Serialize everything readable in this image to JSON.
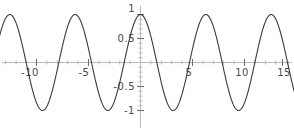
{
  "chart_data": {
    "type": "line",
    "title": "",
    "subtitle": "",
    "xlabel": "",
    "ylabel": "",
    "function": "cos(x)",
    "xlim": [
      -13.7,
      15.0
    ],
    "ylim": [
      -1.0,
      1.0
    ],
    "grid": false,
    "legend": null,
    "legend_position": "none",
    "x_ticks": [
      -10,
      -5,
      5,
      10,
      15
    ],
    "x_tick_labels": [
      "-10",
      "-5",
      "5",
      "10",
      "15"
    ],
    "y_ticks": [
      1,
      0.5,
      -0.5,
      -1
    ],
    "y_tick_labels": [
      "1",
      "0.5",
      "-0.5",
      "-1"
    ],
    "x_minor_tick_step": 1,
    "y_minor_tick_step": 0.1,
    "series": [
      {
        "name": "cos(x)",
        "color": "#3a3a3a",
        "x": [
          -13.7,
          -13.4,
          -13.0,
          -12.6,
          -12.2,
          -11.8,
          -11.4,
          -11.0,
          -10.6,
          -10.2,
          -9.8,
          -9.4,
          -9.0,
          -8.6,
          -8.2,
          -7.8,
          -7.4,
          -7.0,
          -6.6,
          -6.2,
          -5.8,
          -5.4,
          -5.0,
          -4.6,
          -4.2,
          -3.8,
          -3.4,
          -3.0,
          -2.6,
          -2.2,
          -1.8,
          -1.4,
          -1.0,
          -0.6,
          -0.2,
          0.2,
          0.6,
          1.0,
          1.4,
          1.8,
          2.2,
          2.6,
          3.0,
          3.4,
          3.8,
          4.2,
          4.6,
          5.0,
          5.4,
          5.8,
          6.2,
          6.6,
          7.0,
          7.4,
          7.8,
          8.2,
          8.6,
          9.0,
          9.4,
          9.8,
          10.2,
          10.6,
          11.0,
          11.4,
          11.8,
          12.2,
          12.6,
          13.0,
          13.4,
          13.8,
          14.2,
          14.6,
          15.0
        ],
        "y": [
          0.9,
          0.78,
          0.91,
          0.99,
          0.95,
          0.79,
          0.53,
          0.0044,
          -0.28,
          -0.58,
          -0.81,
          -0.97,
          -0.91,
          -0.75,
          -0.39,
          0.016,
          0.4,
          0.75,
          0.95,
          0.996,
          0.89,
          0.63,
          0.28,
          -0.11,
          -0.49,
          -0.79,
          -0.97,
          -0.99,
          -0.86,
          -0.59,
          -0.23,
          0.17,
          0.54,
          0.83,
          0.98,
          0.98,
          0.83,
          0.54,
          0.17,
          -0.23,
          -0.59,
          -0.86,
          -0.99,
          -0.97,
          -0.79,
          -0.49,
          -0.11,
          0.28,
          0.63,
          0.89,
          0.996,
          0.95,
          0.75,
          0.4,
          0.016,
          -0.39,
          -0.75,
          -0.91,
          -0.97,
          -0.81,
          -0.58,
          -0.28,
          0.0044,
          0.53,
          0.79,
          0.95,
          0.99,
          0.91,
          0.78,
          0.6,
          0.25,
          -0.17,
          -0.76
        ]
      }
    ],
    "peaks_x": [
      -12.566,
      -6.283,
      0,
      6.283,
      12.566
    ],
    "troughs_x": [
      -9.425,
      -3.142,
      3.142,
      9.425
    ],
    "amplitude": 1,
    "period": 6.2832
  },
  "axes": {
    "x_axis_color": "#b9b9b9",
    "y_axis_color": "#b9b9b9",
    "tick_color": "#6e6e6e",
    "label_color": "#4a4a4a"
  },
  "background": "#ffffff"
}
